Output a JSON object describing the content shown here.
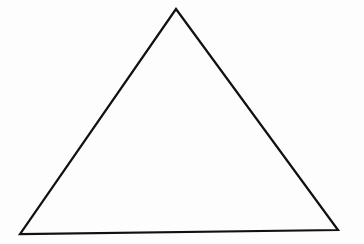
{
  "diagram": {
    "shape": "triangle",
    "vertices": {
      "apex": [
        176,
        9
      ],
      "bottom_left": [
        20,
        234
      ],
      "bottom_right": [
        338,
        230
      ]
    },
    "stroke_color": "#111111",
    "stroke_width": 2.2,
    "fill": "none",
    "background": "#fdfdfd"
  }
}
